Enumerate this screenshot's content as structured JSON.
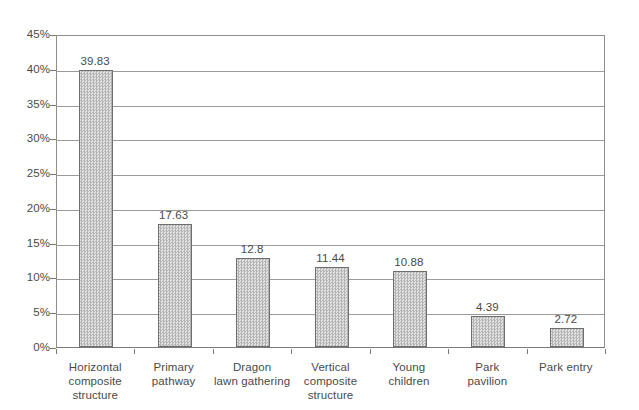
{
  "chart_data": {
    "type": "bar",
    "title": "",
    "subtitle": "",
    "xlabel": "",
    "ylabel": "",
    "categories": [
      "Horizontal\ncomposite\nstructure",
      "Primary\npathway",
      "Dragon\nlawn gathering",
      "Vertical\ncomposite\nstructure",
      "Young\nchildren",
      "Park\npavilion",
      "Park entry"
    ],
    "values": [
      39.83,
      17.63,
      12.8,
      11.44,
      10.88,
      4.39,
      2.72
    ],
    "value_labels": [
      "39.83",
      "17.63",
      "12.8",
      "11.44",
      "10.88",
      "4.39",
      "2.72"
    ],
    "ylim": [
      0,
      45
    ],
    "ytick_values": [
      0,
      5,
      10,
      15,
      20,
      25,
      30,
      35,
      40,
      45
    ],
    "ytick_labels": [
      "0%",
      "5%",
      "10%",
      "15%",
      "20%",
      "25%",
      "30%",
      "35%",
      "40%",
      "45%"
    ],
    "grid": true,
    "legend": null,
    "bar_fill_color": "#d2d2d2",
    "bar_border_color": "#6e6e6e",
    "gridline_color": "#9b9b9b",
    "axis_color": "#7a7a7a",
    "text_color": "#4a4a4a",
    "background_color": "#ffffff"
  }
}
